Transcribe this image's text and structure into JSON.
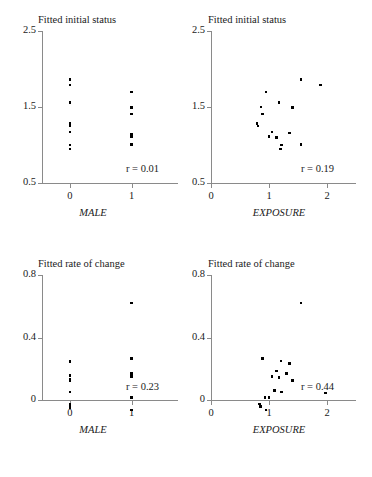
{
  "figure": {
    "width": 372,
    "height": 477,
    "marker_color": "#000000",
    "axis_color": "#8a8a8a",
    "text_color": "#1a1a1a",
    "background": "#ffffff"
  },
  "chart_data": [
    {
      "type": "scatter",
      "panel": "top-left",
      "title": "Fitted initial status",
      "xlabel": "MALE",
      "ylabel": "",
      "xlim": [
        -0.45,
        1.75
      ],
      "ylim": [
        0.5,
        2.5
      ],
      "xticks": [
        0,
        1
      ],
      "xticklabels": [
        "0",
        "1"
      ],
      "yticks": [
        0.5,
        1.5,
        2.5
      ],
      "yticklabels": [
        "0.5",
        "1.5",
        "2.5"
      ],
      "grid": false,
      "legend": null,
      "annotation": "r = 0.01",
      "points": [
        {
          "x": 0,
          "y": 1.86
        },
        {
          "x": 0,
          "y": 1.79
        },
        {
          "x": 0,
          "y": 1.56
        },
        {
          "x": 0,
          "y": 1.28
        },
        {
          "x": 0,
          "y": 1.25
        },
        {
          "x": 0,
          "y": 1.17
        },
        {
          "x": 0,
          "y": 1.0
        },
        {
          "x": 0,
          "y": 0.95
        },
        {
          "x": 1,
          "y": 1.7
        },
        {
          "x": 1,
          "y": 1.49
        },
        {
          "x": 1,
          "y": 1.41
        },
        {
          "x": 1,
          "y": 1.14
        },
        {
          "x": 1,
          "y": 1.11
        },
        {
          "x": 1,
          "y": 1.01
        }
      ]
    },
    {
      "type": "scatter",
      "panel": "top-right",
      "title": "Fitted initial status",
      "xlabel": "EXPOSURE",
      "ylabel": "",
      "xlim": [
        0,
        2.5
      ],
      "ylim": [
        0.5,
        2.5
      ],
      "xticks": [
        0,
        1,
        2
      ],
      "xticklabels": [
        "0",
        "1",
        "2"
      ],
      "yticks": [
        0.5,
        1.5,
        2.5
      ],
      "yticklabels": [
        "0.5",
        "1.5",
        "2.5"
      ],
      "grid": false,
      "legend": null,
      "annotation": "r = 0.19",
      "points": [
        {
          "x": 1.55,
          "y": 1.86
        },
        {
          "x": 1.89,
          "y": 1.79
        },
        {
          "x": 0.95,
          "y": 1.7
        },
        {
          "x": 1.17,
          "y": 1.56
        },
        {
          "x": 0.86,
          "y": 1.5
        },
        {
          "x": 1.41,
          "y": 1.49
        },
        {
          "x": 0.89,
          "y": 1.41
        },
        {
          "x": 0.79,
          "y": 1.28
        },
        {
          "x": 0.81,
          "y": 1.25
        },
        {
          "x": 1.05,
          "y": 1.17
        },
        {
          "x": 1.35,
          "y": 1.16
        },
        {
          "x": 1.0,
          "y": 1.11
        },
        {
          "x": 1.13,
          "y": 1.1
        },
        {
          "x": 1.55,
          "y": 1.01
        },
        {
          "x": 1.22,
          "y": 1.0
        },
        {
          "x": 1.2,
          "y": 0.95
        }
      ]
    },
    {
      "type": "scatter",
      "panel": "bottom-left",
      "title": "Fitted rate of change",
      "xlabel": "MALE",
      "ylabel": "",
      "xlim": [
        -0.45,
        1.75
      ],
      "ylim": [
        -0.12,
        0.8
      ],
      "xticks": [
        0,
        1
      ],
      "xticklabels": [
        "0",
        "1"
      ],
      "yticks": [
        0,
        0.4,
        0.8
      ],
      "yticklabels": [
        "0",
        "0.4",
        "0.8"
      ],
      "grid": false,
      "legend": null,
      "annotation": "r = 0.23",
      "points": [
        {
          "x": 0,
          "y": 0.245
        },
        {
          "x": 0,
          "y": 0.155
        },
        {
          "x": 0,
          "y": 0.135
        },
        {
          "x": 0,
          "y": 0.125
        },
        {
          "x": 0,
          "y": 0.05
        },
        {
          "x": 0,
          "y": -0.025
        },
        {
          "x": 0,
          "y": -0.04
        },
        {
          "x": 0,
          "y": -0.048
        },
        {
          "x": 1,
          "y": 0.62
        },
        {
          "x": 1,
          "y": 0.265
        },
        {
          "x": 1,
          "y": 0.17
        },
        {
          "x": 1,
          "y": 0.15
        },
        {
          "x": 1,
          "y": 0.015
        },
        {
          "x": 1,
          "y": -0.065
        }
      ]
    },
    {
      "type": "scatter",
      "panel": "bottom-right",
      "title": "Fitted rate of change",
      "xlabel": "EXPOSURE",
      "ylabel": "",
      "xlim": [
        0,
        2.5
      ],
      "ylim": [
        -0.12,
        0.8
      ],
      "xticks": [
        0,
        1,
        2
      ],
      "xticklabels": [
        "0",
        "1",
        "2"
      ],
      "yticks": [
        0,
        0.4,
        0.8
      ],
      "yticklabels": [
        "0",
        "0.4",
        "0.8"
      ],
      "grid": false,
      "legend": null,
      "annotation": "r = 0.44",
      "points": [
        {
          "x": 1.55,
          "y": 0.62
        },
        {
          "x": 0.89,
          "y": 0.265
        },
        {
          "x": 1.21,
          "y": 0.25
        },
        {
          "x": 1.35,
          "y": 0.235
        },
        {
          "x": 1.13,
          "y": 0.185
        },
        {
          "x": 1.3,
          "y": 0.17
        },
        {
          "x": 1.05,
          "y": 0.15
        },
        {
          "x": 1.17,
          "y": 0.145
        },
        {
          "x": 1.41,
          "y": 0.125
        },
        {
          "x": 1.09,
          "y": 0.06
        },
        {
          "x": 1.22,
          "y": 0.05
        },
        {
          "x": 1.97,
          "y": 0.045
        },
        {
          "x": 0.93,
          "y": 0.015
        },
        {
          "x": 1.0,
          "y": 0.015
        },
        {
          "x": 0.84,
          "y": -0.025
        },
        {
          "x": 0.85,
          "y": -0.04
        },
        {
          "x": 0.95,
          "y": -0.065
        }
      ]
    }
  ]
}
